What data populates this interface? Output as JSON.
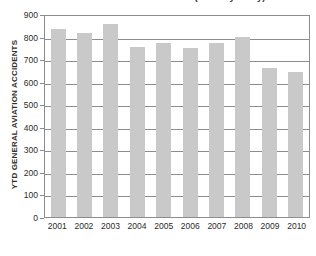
{
  "chart_data": {
    "type": "bar",
    "title": "US General Aviation Accidents (January - May)",
    "xlabel": "",
    "ylabel": "YTD GENERAL AVIATION ACCIDENTS",
    "categories": [
      "2001",
      "2002",
      "2003",
      "2004",
      "2005",
      "2006",
      "2007",
      "2008",
      "2009",
      "2010"
    ],
    "values": [
      835,
      815,
      855,
      755,
      770,
      750,
      770,
      800,
      660,
      645
    ],
    "series": [
      {
        "name": "YTD General Aviation Accidents",
        "values": [
          835,
          815,
          855,
          755,
          770,
          750,
          770,
          800,
          660,
          645
        ]
      }
    ],
    "ylim": [
      0,
      900
    ],
    "ytick_labels": [
      "900",
      "800",
      "700",
      "600",
      "500",
      "400",
      "300",
      "200",
      "100",
      "0"
    ],
    "ytick_values": [
      900,
      800,
      700,
      600,
      500,
      400,
      300,
      200,
      100,
      0
    ],
    "grid": true,
    "legend": false,
    "legend_position": "none",
    "bar_color": "#c9c9c9",
    "axis_color": "#8d8d8d",
    "text_color": "#2b2b2b"
  }
}
